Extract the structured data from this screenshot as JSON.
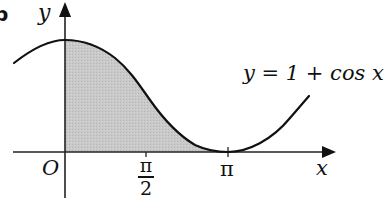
{
  "figure": {
    "part_label": "b",
    "equation": "y = 1 + cos x",
    "axes": {
      "x_label": "x",
      "y_label": "y",
      "origin_label": "O",
      "x_ticks": [
        {
          "label_num": "π",
          "label_den": "2",
          "value": "π/2"
        },
        {
          "label": "π",
          "value": "π"
        }
      ]
    },
    "shaded_region": {
      "description": "Area under y = 1 + cos x from x = 0 to x = π",
      "from": "0",
      "to": "π",
      "fill": "#c8c8c8"
    },
    "colors": {
      "curve": "#111111",
      "axes": "#222222",
      "shade": "#c8c8c8"
    }
  }
}
